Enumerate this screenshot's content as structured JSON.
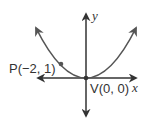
{
  "diagram": {
    "type": "parabola",
    "equation": "y = x^2/4",
    "axes": {
      "x_label": "x",
      "y_label": "y"
    },
    "points": [
      {
        "name": "P",
        "label": "P(−2, 1)",
        "x": -2,
        "y": 1
      },
      {
        "name": "V",
        "label": "V(0, 0)",
        "x": 0,
        "y": 0
      }
    ],
    "colors": {
      "curve": "#555555",
      "axes": "#333333",
      "text": "#333333"
    }
  }
}
